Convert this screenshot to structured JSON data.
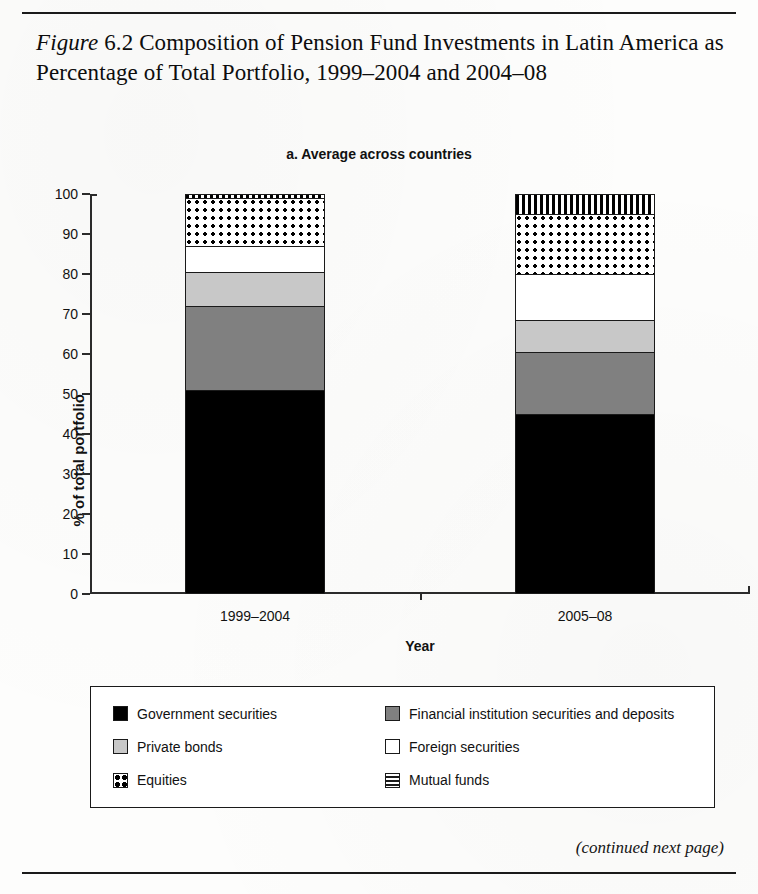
{
  "figure": {
    "label": "Figure",
    "number": "6.2",
    "title_rest": "Composition of Pension Fund Investments in Latin America as Percentage of Total Portfolio, 1999–2004 and 2004–08",
    "footer_note": "(continued next page)"
  },
  "chart_data": {
    "type": "bar",
    "stacked": true,
    "title": "a. Average across countries",
    "xlabel": "Year",
    "ylabel": "% of total portfolio",
    "ylim": [
      0,
      100
    ],
    "ytick_labels": [
      "0",
      "10",
      "20",
      "30",
      "40",
      "50",
      "60",
      "70",
      "80",
      "90",
      "100"
    ],
    "ytick_values": [
      0,
      10,
      20,
      30,
      40,
      50,
      60,
      70,
      80,
      90,
      100
    ],
    "grid": false,
    "legend_position": "below",
    "categories": [
      "1999–2004",
      "2005–08"
    ],
    "series": [
      {
        "name": "Government securities",
        "pattern": "solid-black",
        "color": "#000000",
        "values": [
          51,
          45
        ]
      },
      {
        "name": "Financial institution securities and deposits",
        "pattern": "solid-dark-gray",
        "color": "#808080",
        "values": [
          21,
          15.5
        ]
      },
      {
        "name": "Private bonds",
        "pattern": "solid-light-gray",
        "color": "#c8c8c8",
        "values": [
          8.5,
          8
        ]
      },
      {
        "name": "Foreign securities",
        "pattern": "solid-white",
        "color": "#ffffff",
        "values": [
          6.5,
          11.5
        ]
      },
      {
        "name": "Equities",
        "pattern": "checkered",
        "color": "#ffffff",
        "values": [
          12,
          15
        ]
      },
      {
        "name": "Mutual funds",
        "pattern": "striped",
        "color": "#ffffff",
        "values": [
          1,
          5
        ]
      }
    ]
  },
  "legend": {
    "items": [
      {
        "label": "Government securities",
        "swatch": "sw-black"
      },
      {
        "label": "Financial institution securities and deposits",
        "swatch": "sw-dgray"
      },
      {
        "label": "Private bonds",
        "swatch": "sw-lgray"
      },
      {
        "label": "Foreign securities",
        "swatch": "sw-white"
      },
      {
        "label": "Equities",
        "swatch": "sw-equity"
      },
      {
        "label": "Mutual funds",
        "swatch": "sw-mutual"
      }
    ]
  }
}
